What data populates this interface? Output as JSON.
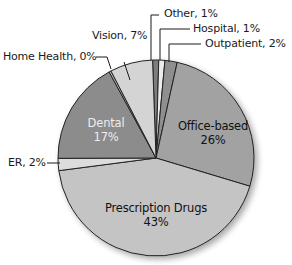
{
  "chart_data": {
    "type": "pie",
    "title": "",
    "start_angle_deg": -2,
    "direction": "clockwise",
    "center": [
      156,
      158
    ],
    "radius": 98,
    "slices": [
      {
        "label": "Other",
        "value": 1,
        "display": "Other, 1%",
        "color": "#7d7d7d"
      },
      {
        "label": "Hospital",
        "value": 1,
        "display": "Hospital, 1%",
        "color": "#ececec"
      },
      {
        "label": "Outpatient",
        "value": 2,
        "display": "Outpatient, 2%",
        "color": "#8f8f8f"
      },
      {
        "label": "Office-based",
        "value": 26,
        "display": "Office-based 26%",
        "color": "#a2a2a2"
      },
      {
        "label": "Prescription Drugs",
        "value": 43,
        "display": "Prescription Drugs 43%",
        "color": "#c4c4c4"
      },
      {
        "label": "ER",
        "value": 2,
        "display": "ER, 2%",
        "color": "#dcdcdc"
      },
      {
        "label": "Dental",
        "value": 17,
        "display": "Dental 17%",
        "color": "#8c8c8c"
      },
      {
        "label": "Home Health",
        "value": 0,
        "display": "Home Health, 0%",
        "color": "#bdbdbd"
      },
      {
        "label": "Vision",
        "value": 7,
        "display": "Vision, 7%",
        "color": "#d4d4d4"
      }
    ],
    "categories": [
      "Other",
      "Hospital",
      "Outpatient",
      "Office-based",
      "Prescription Drugs",
      "ER",
      "Dental",
      "Home Health",
      "Vision"
    ],
    "values": [
      1,
      1,
      2,
      26,
      43,
      2,
      17,
      0,
      7
    ],
    "unit": "%",
    "legend": "none (direct labels)"
  },
  "labels": {
    "other": "Other, 1%",
    "hospital": "Hospital, 1%",
    "outpatient": "Outpatient, 2%",
    "vision": "Vision, 7%",
    "home_health": "Home Health, 0%",
    "er": "ER, 2%",
    "dental_name": "Dental",
    "dental_pct": "17%",
    "office_name": "Office-based",
    "office_pct": "26%",
    "rx_name": "Prescription Drugs",
    "rx_pct": "43%"
  }
}
